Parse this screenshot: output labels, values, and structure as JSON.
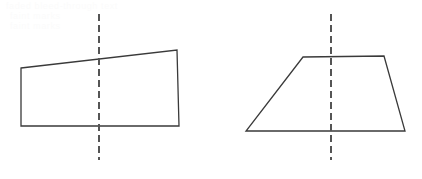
{
  "canvas": {
    "width": 422,
    "height": 179,
    "background_color": "#ffffff",
    "stroke_color": "#3a3a3a",
    "stroke_width": 1.3
  },
  "ghost_text": {
    "line_1": "faded bleed-through text",
    "line_2": "faint marks",
    "line_3": "faint marks",
    "color": "#fbfbfb"
  },
  "figures": [
    {
      "id": "left-figure",
      "shape_name": "quadrilateral",
      "label": "Quadrilateral with dashed vertical line",
      "vertices": [
        {
          "x": 21,
          "y": 68
        },
        {
          "x": 177,
          "y": 50
        },
        {
          "x": 179,
          "y": 126
        },
        {
          "x": 21,
          "y": 126
        }
      ],
      "points_string": "21,68 177,50 179,126 21,126",
      "dashed_line": {
        "label": "vertical dashed line",
        "x": 99,
        "y_start": 14,
        "y_end": 160,
        "dash_length": 7,
        "gap_length": 4,
        "color": "#555555",
        "width": 2
      }
    },
    {
      "id": "right-figure",
      "shape_name": "trapezoid",
      "label": "Trapezoid with dashed vertical line",
      "vertices": [
        {
          "x": 303,
          "y": 57
        },
        {
          "x": 384,
          "y": 56
        },
        {
          "x": 405,
          "y": 131
        },
        {
          "x": 246,
          "y": 131
        }
      ],
      "points_string": "303,57 384,56 405,131 246,131",
      "dashed_line": {
        "label": "vertical dashed line",
        "x": 331,
        "y_start": 14,
        "y_end": 160,
        "dash_length": 7,
        "gap_length": 4,
        "color": "#555555",
        "width": 2
      }
    }
  ]
}
